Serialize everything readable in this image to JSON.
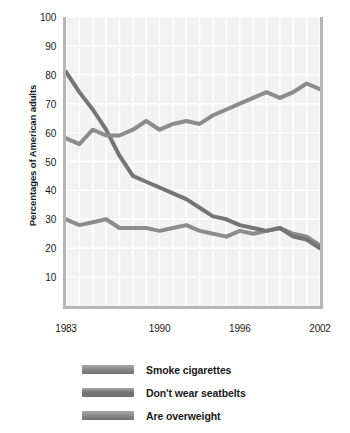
{
  "chart_data": {
    "type": "line",
    "title": "",
    "xlabel": "",
    "ylabel": "Percentages of American adults",
    "xlim": [
      1983,
      2002
    ],
    "ylim": [
      0,
      100
    ],
    "yticks": [
      100,
      90,
      80,
      70,
      60,
      50,
      40,
      30,
      20,
      10
    ],
    "xticks": [
      1983,
      1990,
      1996,
      2002
    ],
    "xtick_labels": [
      "1983",
      "1990",
      "1996",
      "2002"
    ],
    "grid": true,
    "legend_position": "below",
    "x": [
      1983,
      1984,
      1985,
      1986,
      1987,
      1988,
      1989,
      1990,
      1991,
      1992,
      1993,
      1994,
      1995,
      1996,
      1997,
      1998,
      1999,
      2000,
      2001,
      2002
    ],
    "series": [
      {
        "name": "Smoke cigarettes",
        "color": "#8c8c8c",
        "values": [
          30,
          28,
          29,
          30,
          27,
          27,
          27,
          26,
          27,
          28,
          26,
          25,
          24,
          26,
          25,
          26,
          27,
          25,
          24,
          21
        ]
      },
      {
        "name": "Don't wear seatbelts",
        "color": "#757575",
        "values": [
          81,
          74,
          68,
          61,
          52,
          45,
          43,
          41,
          39,
          37,
          34,
          31,
          30,
          28,
          27,
          26,
          27,
          24,
          23,
          20
        ]
      },
      {
        "name": "Are overweight",
        "color": "#8c8c8c",
        "values": [
          58,
          56,
          61,
          59,
          59,
          61,
          64,
          61,
          63,
          64,
          63,
          66,
          68,
          70,
          72,
          74,
          72,
          74,
          77,
          75
        ]
      }
    ],
    "colors": {
      "plot_background": "#f2f2f2",
      "gridline": "#ffffff",
      "axis": "#b6b6b6",
      "text": "#1a1a1a"
    }
  },
  "legend": {
    "items": [
      {
        "label": "Smoke cigarettes",
        "swatch": "#8c8c8c"
      },
      {
        "label": "Don't wear seatbelts",
        "swatch": "#757575"
      },
      {
        "label": "Are overweight",
        "swatch": "#8c8c8c"
      }
    ]
  }
}
